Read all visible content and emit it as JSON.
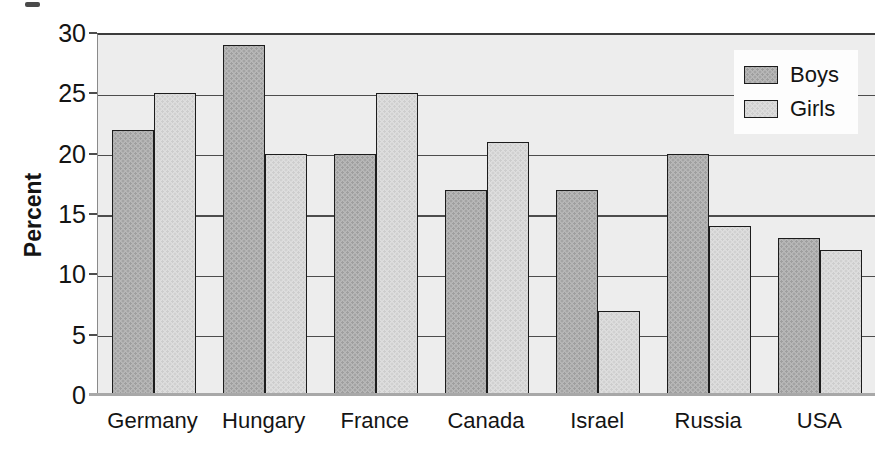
{
  "chart_data": {
    "type": "bar",
    "ylabel": "Percent",
    "xlabel": "",
    "ylim": [
      0,
      30
    ],
    "yticks": [
      0,
      5,
      10,
      15,
      20,
      25,
      30
    ],
    "grid": true,
    "legend_position": "top-right",
    "categories": [
      "Germany",
      "Hungary",
      "France",
      "Canada",
      "Israel",
      "Russia",
      "USA"
    ],
    "series": [
      {
        "name": "Boys",
        "values": [
          22,
          29,
          20,
          17,
          17,
          20,
          13
        ]
      },
      {
        "name": "Girls",
        "values": [
          25,
          20,
          25,
          21,
          7,
          14,
          12
        ]
      }
    ],
    "colors": {
      "boys_bar": "#b8b8b8",
      "girls_bar": "#dedede",
      "plot_background": "#ededed",
      "gridline": "#4d4d4d",
      "bar_border": "#1c1c1c",
      "legend_background": "#fdfdfd",
      "text": "#141414"
    }
  }
}
